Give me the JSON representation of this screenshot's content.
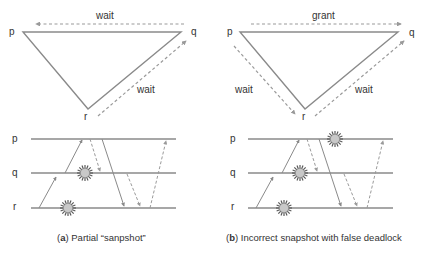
{
  "colors": {
    "solid_line": "#8a8a8a",
    "dashed_line": "#9a9a9a",
    "text": "#333333",
    "snapshot_fill": "#c8c8c8",
    "snapshot_spikes": "#5a5a5a"
  },
  "panels": [
    {
      "id": "a",
      "graph": {
        "nodes": [
          {
            "label": "p",
            "x": 23,
            "y": 32
          },
          {
            "label": "q",
            "x": 181,
            "y": 32
          },
          {
            "label": "r",
            "x": 88,
            "y": 109
          }
        ],
        "edges": [
          {
            "from": "q",
            "to": "p",
            "label": "wait",
            "style": "dashed"
          },
          {
            "from": "r",
            "to": "q",
            "label": "wait",
            "style": "dashed"
          }
        ]
      },
      "timelines": [
        "p",
        "q",
        "r"
      ],
      "caption_letter": "a",
      "caption_text": " Partial “sanpshot”"
    },
    {
      "id": "b",
      "graph": {
        "nodes": [
          {
            "label": "p",
            "x": 240,
            "y": 32
          },
          {
            "label": "q",
            "x": 398,
            "y": 32
          },
          {
            "label": "r",
            "x": 305,
            "y": 109
          }
        ],
        "edges": [
          {
            "from": "p",
            "to": "q",
            "label": "grant",
            "style": "dashed"
          },
          {
            "from": "p",
            "to": "r",
            "label": "wait",
            "style": "dashed"
          },
          {
            "from": "r",
            "to": "q",
            "label": "wait",
            "style": "dashed"
          }
        ]
      },
      "timelines": [
        "p",
        "q",
        "r"
      ],
      "caption_letter": "b",
      "caption_text": " Incorrect snapshot with false deadlock"
    }
  ],
  "labels": {
    "a_p": "p",
    "a_q": "q",
    "a_r": "r",
    "a_wait_top": "wait",
    "a_wait_right": "wait",
    "a_tl_p": "p",
    "a_tl_q": "q",
    "a_tl_r": "r",
    "b_p": "p",
    "b_q": "q",
    "b_r": "r",
    "b_grant": "grant",
    "b_wait_left": "wait",
    "b_wait_right": "wait",
    "b_tl_p": "p",
    "b_tl_q": "q",
    "b_tl_r": "r",
    "paren_open": "(",
    "paren_close": ")"
  }
}
